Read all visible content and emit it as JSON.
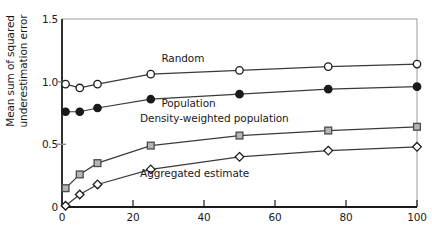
{
  "chart_data": {
    "type": "line",
    "title": "",
    "xlabel": "",
    "ylabel": "Mean sum of squared\nunderestimation error",
    "xlim": [
      0,
      100
    ],
    "ylim": [
      0,
      1.5
    ],
    "xticks": [
      0,
      20,
      40,
      60,
      80,
      100
    ],
    "yticks": [
      0,
      0.5,
      1.0,
      1.5
    ],
    "xtick_labels": [
      "0",
      "20",
      "40",
      "60",
      "80",
      "100"
    ],
    "ytick_labels": [
      "0",
      "0.5",
      "1.0",
      "1.5"
    ],
    "grid": false,
    "legend_position": "inline-annotations",
    "x": [
      1,
      5,
      10,
      25,
      50,
      75,
      100
    ],
    "series": [
      {
        "name": "Random",
        "marker": "open-circle",
        "color": "#1a1a1a",
        "fill": "#ffffff",
        "values": [
          0.98,
          0.95,
          0.98,
          1.06,
          1.09,
          1.12,
          1.14
        ],
        "label_x": 28,
        "label_y": 1.18
      },
      {
        "name": "Population",
        "marker": "filled-circle",
        "color": "#1a1a1a",
        "fill": "#1a1a1a",
        "values": [
          0.76,
          0.76,
          0.79,
          0.86,
          0.9,
          0.94,
          0.96
        ],
        "label_x": 28,
        "label_y": 0.82
      },
      {
        "name": "Density-weighted population",
        "marker": "square",
        "color": "#4a4a4a",
        "fill": "#b5b5b5",
        "values": [
          0.15,
          0.26,
          0.35,
          0.49,
          0.57,
          0.61,
          0.64
        ],
        "label_x": 22,
        "label_y": 0.7
      },
      {
        "name": "Aggregated estimate",
        "marker": "open-diamond",
        "color": "#1a1a1a",
        "fill": "#ffffff",
        "values": [
          0.01,
          0.1,
          0.18,
          0.3,
          0.4,
          0.45,
          0.48
        ],
        "label_x": 22,
        "label_y": 0.26
      }
    ]
  },
  "axis": {
    "frame_color": "#9a9a9a",
    "spine_color": "#1a1a1a"
  }
}
